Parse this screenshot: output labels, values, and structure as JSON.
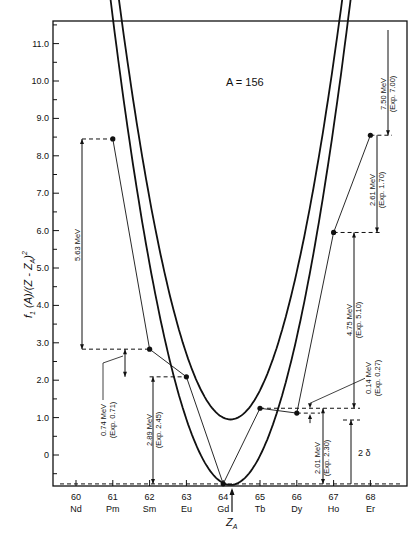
{
  "chart_data": {
    "type": "line",
    "title": "A = 156",
    "xlabel": "Z_A",
    "ylabel": "f1 (A)/(Z - Z_A)^2",
    "x_ticks": [
      60,
      61,
      62,
      63,
      64,
      65,
      66,
      67,
      68
    ],
    "x_tick_labels": [
      "60",
      "61",
      "62",
      "63",
      "64",
      "65",
      "66",
      "67",
      "68"
    ],
    "element_labels": [
      "Nd",
      "Pm",
      "Sm",
      "Eu",
      "Gd",
      "Tb",
      "Dy",
      "Ho",
      "Er"
    ],
    "y_ticks": [
      0,
      1,
      2,
      3,
      4,
      5,
      6,
      7,
      8,
      9,
      10,
      11
    ],
    "y_tick_labels": [
      "0",
      "1.0",
      "2.0",
      "3.0",
      "4.0",
      "5.0",
      "6.0",
      "7.0",
      "8.0",
      "9.0",
      "10.0",
      "11.0"
    ],
    "xlim": [
      59.5,
      69.0
    ],
    "ylim": [
      -0.85,
      11.9
    ],
    "grid": false,
    "z_a": 64.2,
    "series": [
      {
        "name": "odd-Z parabola (upper)",
        "kind": "curve",
        "vertex_x": 64.2,
        "vertex_y": 0.95,
        "a": 1.22,
        "x_range": [
          60.8,
          68.1
        ]
      },
      {
        "name": "even-Z parabola (lower)",
        "kind": "curve",
        "vertex_x": 64.2,
        "vertex_y": -0.8,
        "a": 1.22,
        "x_range": [
          60.0,
          67.85
        ]
      },
      {
        "name": "decay chain",
        "kind": "points",
        "x": [
          61,
          62,
          63,
          64,
          65,
          66,
          67,
          68
        ],
        "element": [
          "Pm",
          "Sm",
          "Eu",
          "Gd",
          "Tb",
          "Dy",
          "Ho",
          "Er"
        ],
        "y": [
          8.45,
          2.83,
          2.09,
          -0.77,
          1.25,
          1.12,
          5.95,
          8.55
        ]
      }
    ],
    "annotations": [
      {
        "text": "5.63 MeV",
        "from": "Pm",
        "to": "Sm"
      },
      {
        "text": "0.74 MeV",
        "sub": "(Exp. 0.71)",
        "from": "Sm",
        "to": "Eu"
      },
      {
        "text": "2.89 MeV",
        "sub": "(Exp. 2.45)",
        "from": "Eu",
        "to": "Gd"
      },
      {
        "text": "2.01 MeV",
        "sub": "(Exp. 2.30)",
        "from": "Tb",
        "to": "Gd"
      },
      {
        "text": "0.14 MeV",
        "sub": "(Exp. 0.27)",
        "from": "Tb",
        "to": "Dy"
      },
      {
        "text": "4.75 MeV",
        "sub": "(Exp. 5.10)",
        "from": "Ho",
        "to": "Dy"
      },
      {
        "text": "2.61 MeV",
        "sub": "(Exp. 1.70)",
        "from": "Er",
        "to": "Ho"
      },
      {
        "text": "7.50 MeV",
        "sub": "(Exp. 7.00)",
        "from": "top",
        "to": "Er"
      },
      {
        "text": "2 δ",
        "from": "odd-even",
        "to": "baseline"
      }
    ]
  }
}
